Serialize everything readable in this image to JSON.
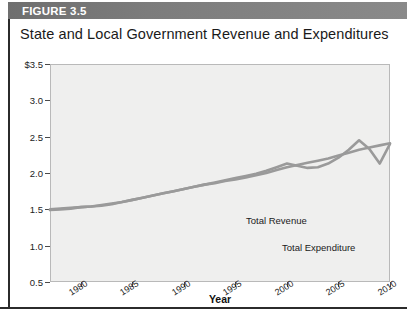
{
  "figure": {
    "header_label": "FIGURE 3.5",
    "title": "State and Local Government Revenue and Expenditures",
    "header_color": "#7c7c7c",
    "plot_background": "#efefee",
    "line_color": "#9a9a9a"
  },
  "chart_data": {
    "type": "line",
    "title": "State and Local Government Revenue and Expenditures",
    "xlabel": "Year",
    "ylabel": "Trillions of 2010 Dollars",
    "xlim": [
      1977,
      2010
    ],
    "ylim": [
      0.5,
      3.5
    ],
    "ytick_labels": [
      "$3.5",
      "3.0",
      "2.5",
      "2.0",
      "1.5",
      "1.0",
      "0.5"
    ],
    "ytick_values": [
      3.5,
      3.0,
      2.5,
      2.0,
      1.5,
      1.0,
      0.5
    ],
    "xtick_labels": [
      "1980",
      "1985",
      "1990",
      "1995",
      "2000",
      "2005",
      "2010"
    ],
    "xtick_values": [
      1980,
      1985,
      1990,
      1995,
      2000,
      2005,
      2010
    ],
    "grid": false,
    "legend": "annotations",
    "annotations": [
      {
        "text": "Total Revenue",
        "x": 1996,
        "y": 2.15
      },
      {
        "text": "Total Expenditure",
        "x": 1999,
        "y": 1.82
      }
    ],
    "x": [
      1977,
      1978,
      1979,
      1980,
      1981,
      1982,
      1983,
      1984,
      1985,
      1986,
      1987,
      1988,
      1989,
      1990,
      1991,
      1992,
      1993,
      1994,
      1995,
      1996,
      1997,
      1998,
      1999,
      2000,
      2001,
      2002,
      2003,
      2004,
      2005,
      2006,
      2007,
      2008,
      2009,
      2010
    ],
    "series": [
      {
        "name": "Total Revenue",
        "values": [
          1.5,
          1.51,
          1.52,
          1.53,
          1.54,
          1.55,
          1.57,
          1.6,
          1.63,
          1.66,
          1.69,
          1.72,
          1.75,
          1.78,
          1.81,
          1.84,
          1.87,
          1.9,
          1.93,
          1.96,
          1.99,
          2.03,
          2.08,
          2.13,
          2.1,
          2.07,
          2.08,
          2.13,
          2.21,
          2.32,
          2.45,
          2.33,
          2.13,
          2.4
        ]
      },
      {
        "name": "Total Expenditure",
        "values": [
          1.49,
          1.5,
          1.51,
          1.53,
          1.54,
          1.56,
          1.58,
          1.6,
          1.63,
          1.66,
          1.69,
          1.72,
          1.75,
          1.78,
          1.81,
          1.84,
          1.86,
          1.89,
          1.91,
          1.94,
          1.97,
          2.0,
          2.04,
          2.08,
          2.11,
          2.14,
          2.17,
          2.2,
          2.24,
          2.28,
          2.32,
          2.35,
          2.38,
          2.41
        ]
      }
    ]
  }
}
